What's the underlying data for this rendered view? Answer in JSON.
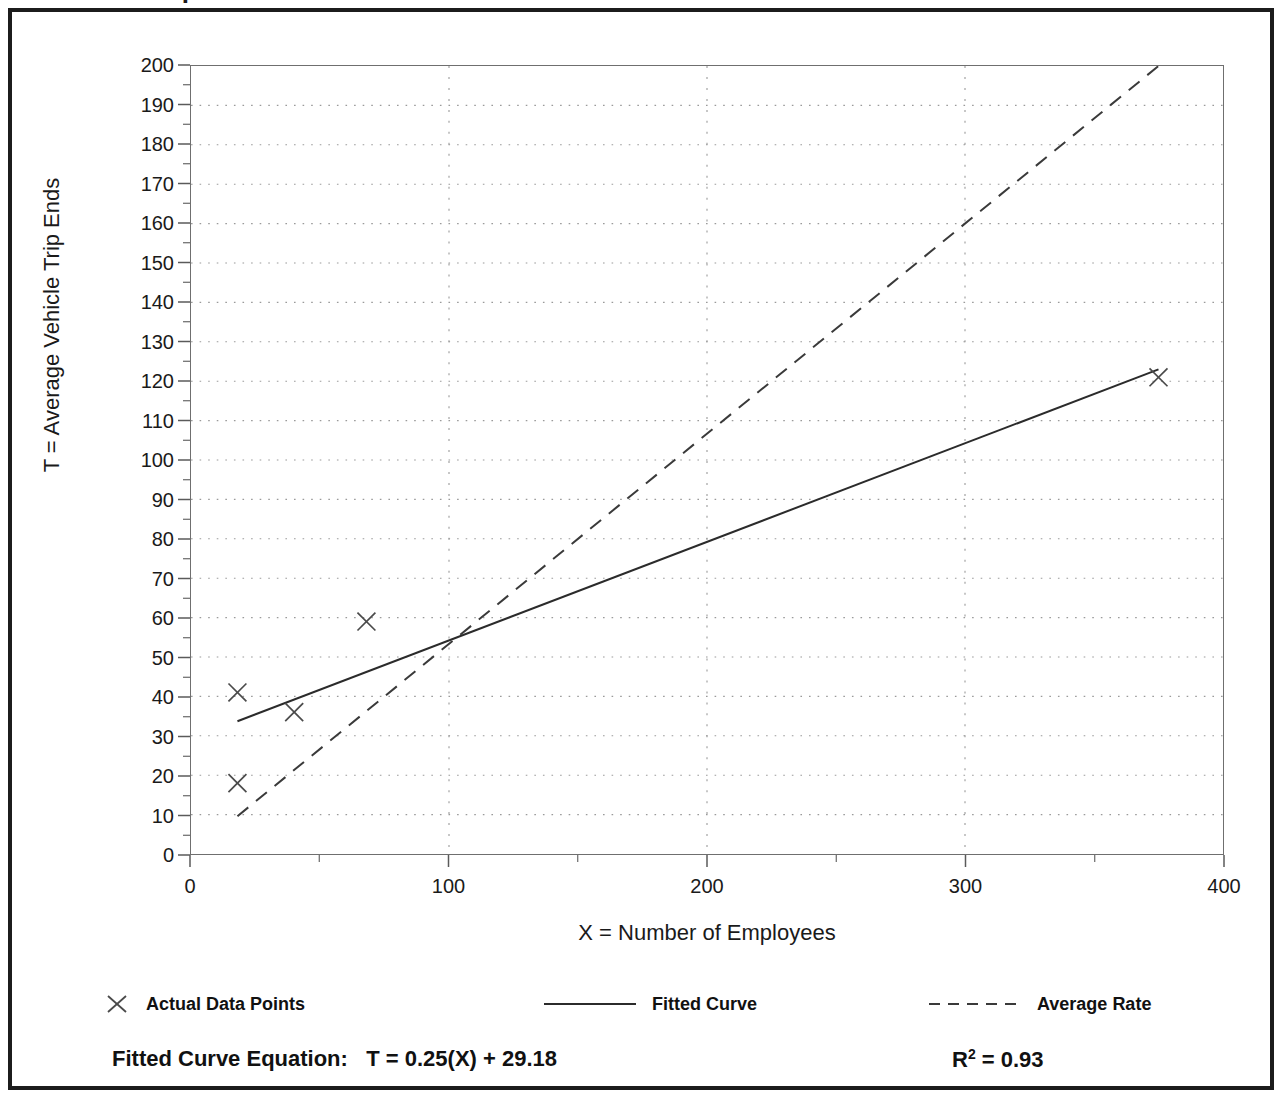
{
  "figure": {
    "cut_off_title": "Trip Generation Plot",
    "frame_color": "#1c1c1c",
    "background": "#ffffff"
  },
  "chart_data": {
    "type": "scatter",
    "title": "",
    "xlabel": "X = Number of Employees",
    "ylabel": "T = Average Vehicle Trip Ends",
    "xlim": [
      0,
      400
    ],
    "ylim": [
      0,
      200
    ],
    "x_major_ticks": [
      0,
      100,
      200,
      300,
      400
    ],
    "x_minor_tick_step": 50,
    "y_major_ticks": [
      0,
      10,
      20,
      30,
      40,
      50,
      60,
      70,
      80,
      90,
      100,
      110,
      120,
      130,
      140,
      150,
      160,
      170,
      180,
      190,
      200
    ],
    "y_minor_tick_step": 5,
    "grid": true,
    "grid_style": "dotted",
    "grid_color": "#9a9a9a",
    "legend_position": "below-plot",
    "series": [
      {
        "name": "Actual Data Points",
        "type": "scatter",
        "marker": "x",
        "color": "#4a4a4a",
        "points": [
          {
            "x": 18,
            "y": 41
          },
          {
            "x": 18,
            "y": 18
          },
          {
            "x": 40,
            "y": 36
          },
          {
            "x": 68,
            "y": 59
          },
          {
            "x": 375,
            "y": 121
          }
        ]
      },
      {
        "name": "Fitted Curve",
        "type": "line",
        "dash": "solid",
        "color": "#2b2b2b",
        "equation": "T = 0.25(X) + 29.18",
        "slope": 0.25,
        "intercept": 29.18,
        "x_from": 18,
        "x_to": 375,
        "y_from": 33.7,
        "y_to": 123.0
      },
      {
        "name": "Average Rate",
        "type": "line",
        "dash": "dashed",
        "color": "#3a3a3a",
        "slope": 0.5333,
        "intercept": 0,
        "x_from": 18,
        "x_to": 375,
        "y_from": 9.6,
        "y_to": 200
      }
    ],
    "y_tick_labels": [
      "0",
      "10",
      "20",
      "30",
      "40",
      "50",
      "60",
      "70",
      "80",
      "90",
      "100",
      "110",
      "120",
      "130",
      "140",
      "150",
      "160",
      "170",
      "180",
      "190",
      "200"
    ],
    "x_tick_labels": [
      "0",
      "100",
      "200",
      "300",
      "400"
    ]
  },
  "legend": {
    "items": [
      {
        "label": "Actual Data Points",
        "marker": "x-marker-icon",
        "left": 30
      },
      {
        "label": "Fitted Curve",
        "marker": "solid-line-icon",
        "left": 470
      },
      {
        "label": "Average Rate",
        "marker": "dashed-line-icon",
        "left": 855
      }
    ]
  },
  "footer": {
    "equation_label": "Fitted Curve Equation:",
    "equation_value": "T = 0.25(X) + 29.18",
    "equation_full": "Fitted Curve Equation:  T = 0.25(X) + 29.18",
    "r_squared_symbol": "R",
    "r_squared_exponent": "2",
    "r_squared_value": "= 0.93",
    "r_squared_full": "R2 = 0.93"
  }
}
